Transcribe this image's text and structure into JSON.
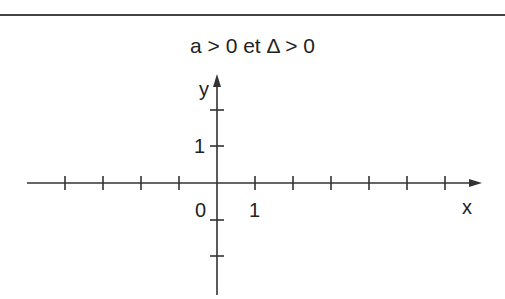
{
  "figure": {
    "title": "a > 0 et Δ > 0",
    "axes": {
      "x_label": "x",
      "y_label": "y",
      "origin_label": "0",
      "x_unit_label": "1",
      "y_unit_label": "1"
    },
    "colors": {
      "axis": "#333333",
      "text": "#222222",
      "background": "#ffffff"
    }
  }
}
